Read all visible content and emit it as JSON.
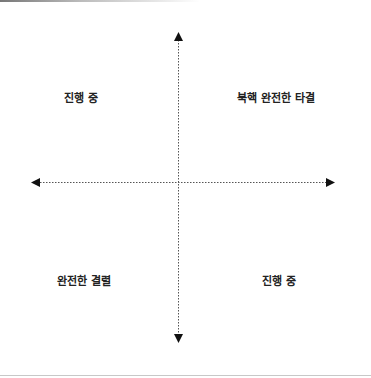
{
  "diagram": {
    "type": "quadrant",
    "axes": {
      "vertical": {
        "direction": "both",
        "style": "dotted",
        "color": "#555555"
      },
      "horizontal": {
        "direction": "both",
        "style": "dotted",
        "color": "#555555"
      }
    },
    "quadrants": {
      "top_left": {
        "label": "진행 중"
      },
      "top_right": {
        "label": "북핵 완전한 타결"
      },
      "bottom_left": {
        "label": "완전한 결렬"
      },
      "bottom_right": {
        "label": "진행 중"
      }
    },
    "colors": {
      "text": "#222222",
      "axis": "#555555",
      "arrowhead": "#111111"
    }
  }
}
